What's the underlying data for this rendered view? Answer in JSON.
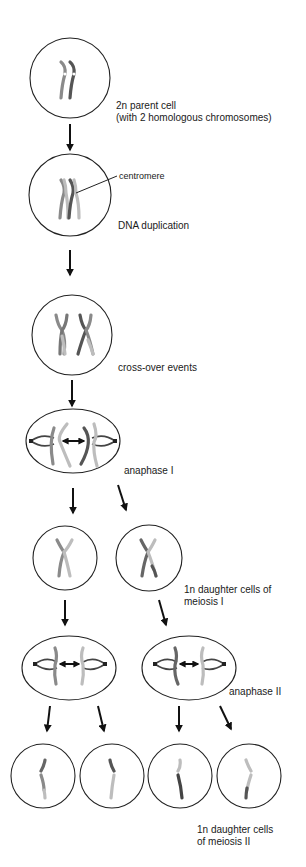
{
  "diagram": {
    "title": "Meiosis",
    "stages": [
      {
        "id": "parent",
        "label": "2n parent cell",
        "sublabel": "(with 2 homologous chromosomes)"
      },
      {
        "id": "duplication",
        "label": "DNA duplication",
        "annotation": "centromere"
      },
      {
        "id": "crossover",
        "label": "cross-over events"
      },
      {
        "id": "anaphase1",
        "label": "anaphase I"
      },
      {
        "id": "daughters1",
        "label": "1n daughter cells of",
        "sublabel": "meiosis I"
      },
      {
        "id": "anaphase2",
        "label": "anaphase II"
      },
      {
        "id": "daughters2",
        "label": "1n daughter cells",
        "sublabel": "of meiosis II"
      }
    ],
    "colors": {
      "outline": "#222222",
      "arrow": "#111111",
      "chromosome_dark": "#555555",
      "chromosome_mid": "#8a8a8a",
      "chromosome_light": "#bdbdbd",
      "background": "#ffffff"
    }
  }
}
